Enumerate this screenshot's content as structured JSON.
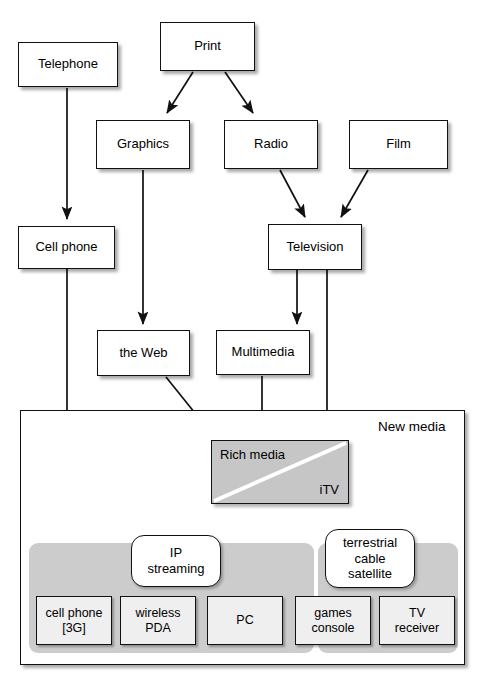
{
  "diagram": {
    "title_label": "New media",
    "nodes": {
      "telephone": "Telephone",
      "print": "Print",
      "graphics": "Graphics",
      "radio": "Radio",
      "film": "Film",
      "cell_phone": "Cell phone",
      "television": "Television",
      "the_web": "the Web",
      "multimedia": "Multimedia",
      "rich_media": "Rich media",
      "itv": "iTV",
      "ip_streaming": "IP\nstreaming",
      "terrestrial": "terrestrial\ncable\nsatellite",
      "cell_phone_3g": "cell phone\n[3G]",
      "wireless_pda": "wireless\nPDA",
      "pc": "PC",
      "games_console": "games\nconsole",
      "tv_receiver": "TV\nreceiver"
    },
    "colors": {
      "stroke": "#111111",
      "node_fill": "#ffffff",
      "band_fill": "#cccccc",
      "rich_media_fill": "#c6c6c6",
      "device_fill": "#efefef",
      "diagonal": "#ffffff"
    },
    "edges": [
      {
        "from": "print",
        "to": "graphics",
        "style": "arrow"
      },
      {
        "from": "print",
        "to": "radio",
        "style": "arrow"
      },
      {
        "from": "telephone",
        "to": "cell_phone",
        "style": "arrow"
      },
      {
        "from": "graphics",
        "to": "the_web",
        "style": "arrow"
      },
      {
        "from": "radio",
        "to": "television",
        "style": "arrow"
      },
      {
        "from": "film",
        "to": "television",
        "style": "arrow"
      },
      {
        "from": "television",
        "to": "multimedia",
        "style": "arrow"
      },
      {
        "from": "cell_phone",
        "to": "new_media",
        "style": "arrow"
      },
      {
        "from": "the_web",
        "to": "rich_media",
        "style": "arrow"
      },
      {
        "from": "multimedia",
        "to": "rich_media",
        "style": "arrow"
      },
      {
        "from": "television",
        "to": "rich_media",
        "style": "arrow"
      },
      {
        "from": "rich_media",
        "to": "ip_streaming",
        "style": "arrow"
      },
      {
        "from": "rich_media",
        "to": "terrestrial",
        "style": "arrow"
      }
    ]
  }
}
